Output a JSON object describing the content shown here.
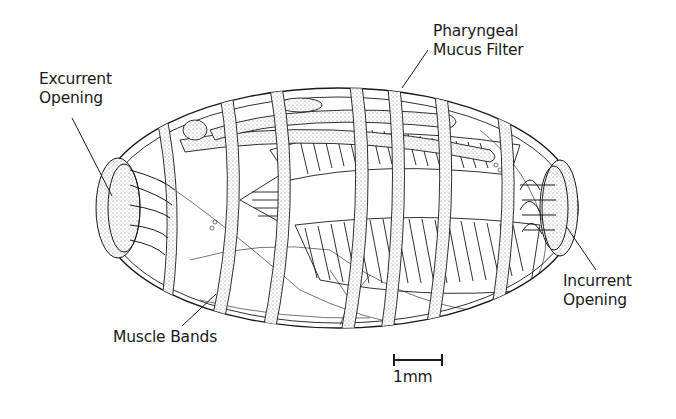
{
  "diagram": {
    "labels": {
      "excurrent_line1": "Excurrent",
      "excurrent_line2": "Opening",
      "pharyngeal_line1": "Pharyngeal",
      "pharyngeal_line2": "Mucus Filter",
      "incurrent_line1": "Incurrent",
      "incurrent_line2": "Opening",
      "muscle_bands": "Muscle Bands"
    },
    "scale_bar": {
      "label": "1mm"
    },
    "colors": {
      "ink": "#1a1a1a",
      "shading": "#8a8a8a",
      "background": "#ffffff"
    }
  }
}
